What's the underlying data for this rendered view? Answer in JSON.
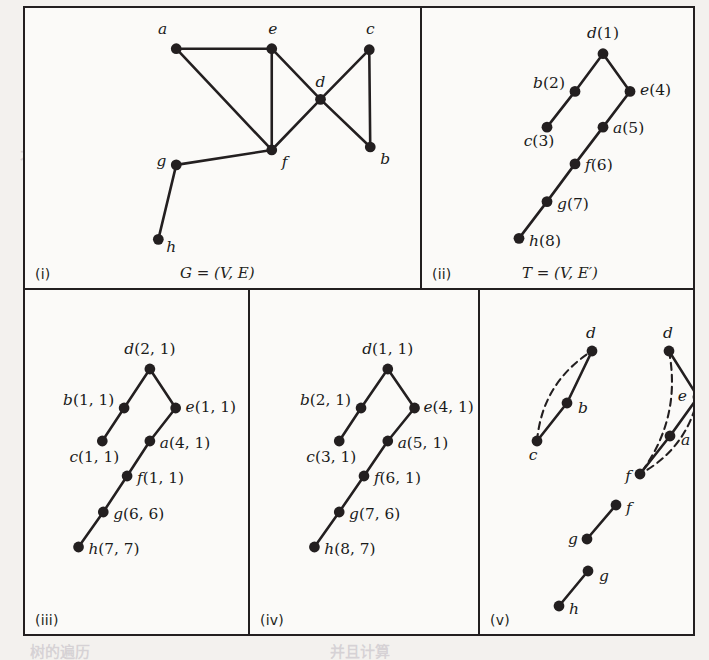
{
  "figure": {
    "title_absent": true,
    "background_color": "#f3f1ee",
    "paper_color": "#fbfaf8",
    "ink_color": "#231f20"
  },
  "panels": [
    {
      "id": "i",
      "tag": "(i)",
      "caption": "G = (V, E)",
      "kind": "graph",
      "nodes": [
        {
          "id": "a",
          "label": "a",
          "x": 152,
          "y": 41,
          "lx": 143,
          "ly": 26,
          "anchor": "end"
        },
        {
          "id": "e",
          "label": "e",
          "x": 248,
          "y": 41,
          "lx": 249,
          "ly": 26,
          "anchor": "middle"
        },
        {
          "id": "c",
          "label": "c",
          "x": 346,
          "y": 42,
          "lx": 347,
          "ly": 26,
          "anchor": "middle"
        },
        {
          "id": "d",
          "label": "d",
          "x": 297,
          "y": 92,
          "lx": 297,
          "ly": 80,
          "anchor": "middle"
        },
        {
          "id": "b",
          "label": "b",
          "x": 347,
          "y": 140,
          "lx": 357,
          "ly": 157,
          "anchor": "start"
        },
        {
          "id": "f",
          "label": "f",
          "x": 248,
          "y": 143,
          "lx": 258,
          "ly": 160,
          "anchor": "start"
        },
        {
          "id": "g",
          "label": "g",
          "x": 152,
          "y": 158,
          "lx": 142,
          "ly": 159,
          "anchor": "end"
        },
        {
          "id": "h",
          "label": "h",
          "x": 134,
          "y": 233,
          "lx": 142,
          "ly": 246,
          "anchor": "start"
        }
      ],
      "edges": [
        [
          "a",
          "e"
        ],
        [
          "a",
          "f"
        ],
        [
          "e",
          "f"
        ],
        [
          "e",
          "d"
        ],
        [
          "d",
          "c"
        ],
        [
          "d",
          "b"
        ],
        [
          "d",
          "f"
        ],
        [
          "c",
          "b"
        ],
        [
          "f",
          "g"
        ],
        [
          "g",
          "h"
        ]
      ]
    },
    {
      "id": "ii",
      "tag": "(ii)",
      "caption": "T = (V, E′)",
      "kind": "tree",
      "nodes": [
        {
          "id": "d",
          "label": "d(1)",
          "x": 578,
          "y": 46,
          "lx": 578,
          "ly": 30,
          "anchor": "middle"
        },
        {
          "id": "b",
          "label": "b(2)",
          "x": 550,
          "y": 84,
          "lx": 540,
          "ly": 81,
          "anchor": "end"
        },
        {
          "id": "e",
          "label": "e(4)",
          "x": 605,
          "y": 84,
          "lx": 615,
          "ly": 88,
          "anchor": "start"
        },
        {
          "id": "c",
          "label": "c(3)",
          "x": 522,
          "y": 120,
          "lx": 514,
          "ly": 139,
          "anchor": "middle"
        },
        {
          "id": "a",
          "label": "a(5)",
          "x": 578,
          "y": 120,
          "lx": 588,
          "ly": 126,
          "anchor": "start"
        },
        {
          "id": "f",
          "label": "f(6)",
          "x": 550,
          "y": 157,
          "lx": 560,
          "ly": 163,
          "anchor": "start"
        },
        {
          "id": "g",
          "label": "g(7)",
          "x": 522,
          "y": 195,
          "lx": 532,
          "ly": 202,
          "anchor": "start"
        },
        {
          "id": "h",
          "label": "h(8)",
          "x": 494,
          "y": 232,
          "lx": 504,
          "ly": 240,
          "anchor": "start"
        }
      ],
      "edges": [
        [
          "d",
          "b"
        ],
        [
          "b",
          "c"
        ],
        [
          "d",
          "e"
        ],
        [
          "e",
          "a"
        ],
        [
          "a",
          "f"
        ],
        [
          "f",
          "g"
        ],
        [
          "g",
          "h"
        ]
      ]
    },
    {
      "id": "iii",
      "tag": "(iii)",
      "caption": "",
      "kind": "tree",
      "nodes": [
        {
          "id": "d",
          "label": "d(2, 1)",
          "x": 126,
          "y": 361,
          "lx": 126,
          "ly": 346,
          "anchor": "middle"
        },
        {
          "id": "b",
          "label": "b(1, 1)",
          "x": 100,
          "y": 400,
          "lx": 90,
          "ly": 397,
          "anchor": "end"
        },
        {
          "id": "e",
          "label": "e(1, 1)",
          "x": 152,
          "y": 400,
          "lx": 162,
          "ly": 404,
          "anchor": "start"
        },
        {
          "id": "c",
          "label": "c(1, 1)",
          "x": 78,
          "y": 433,
          "lx": 70,
          "ly": 454,
          "anchor": "middle"
        },
        {
          "id": "a",
          "label": "a(4, 1)",
          "x": 126,
          "y": 433,
          "lx": 136,
          "ly": 440,
          "anchor": "start"
        },
        {
          "id": "f",
          "label": "f(1, 1)",
          "x": 103,
          "y": 468,
          "lx": 113,
          "ly": 475,
          "anchor": "start"
        },
        {
          "id": "g",
          "label": "g(6, 6)",
          "x": 79,
          "y": 504,
          "lx": 89,
          "ly": 511,
          "anchor": "start"
        },
        {
          "id": "h",
          "label": "h(7, 7)",
          "x": 54,
          "y": 539,
          "lx": 64,
          "ly": 546,
          "anchor": "start"
        }
      ],
      "edges": [
        [
          "d",
          "b"
        ],
        [
          "b",
          "c"
        ],
        [
          "d",
          "e"
        ],
        [
          "e",
          "a"
        ],
        [
          "a",
          "f"
        ],
        [
          "f",
          "g"
        ],
        [
          "g",
          "h"
        ]
      ]
    },
    {
      "id": "iv",
      "tag": "(iv)",
      "caption": "",
      "kind": "tree",
      "nodes": [
        {
          "id": "d",
          "label": "d(1, 1)",
          "x": 364,
          "y": 361,
          "lx": 364,
          "ly": 346,
          "anchor": "middle"
        },
        {
          "id": "b",
          "label": "b(2, 1)",
          "x": 337,
          "y": 400,
          "lx": 327,
          "ly": 397,
          "anchor": "end"
        },
        {
          "id": "e",
          "label": "e(4, 1)",
          "x": 391,
          "y": 400,
          "lx": 400,
          "ly": 404,
          "anchor": "start"
        },
        {
          "id": "c",
          "label": "c(3, 1)",
          "x": 315,
          "y": 433,
          "lx": 307,
          "ly": 454,
          "anchor": "middle"
        },
        {
          "id": "a",
          "label": "a(5, 1)",
          "x": 364,
          "y": 433,
          "lx": 374,
          "ly": 440,
          "anchor": "start"
        },
        {
          "id": "f",
          "label": "f(6, 1)",
          "x": 340,
          "y": 468,
          "lx": 350,
          "ly": 475,
          "anchor": "start"
        },
        {
          "id": "g",
          "label": "g(7, 6)",
          "x": 315,
          "y": 504,
          "lx": 325,
          "ly": 511,
          "anchor": "start"
        },
        {
          "id": "h",
          "label": "h(8, 7)",
          "x": 290,
          "y": 539,
          "lx": 300,
          "ly": 546,
          "anchor": "start"
        }
      ],
      "edges": [
        [
          "d",
          "b"
        ],
        [
          "b",
          "c"
        ],
        [
          "d",
          "e"
        ],
        [
          "e",
          "a"
        ],
        [
          "a",
          "f"
        ],
        [
          "f",
          "g"
        ],
        [
          "g",
          "h"
        ]
      ]
    },
    {
      "id": "v",
      "tag": "(v)",
      "caption": "",
      "kind": "components",
      "nodes": [
        {
          "id": "d1",
          "label": "d",
          "x": 567,
          "y": 343,
          "lx": 566,
          "ly": 330,
          "anchor": "middle"
        },
        {
          "id": "b1",
          "label": "b",
          "x": 542,
          "y": 395,
          "lx": 553,
          "ly": 405,
          "anchor": "start"
        },
        {
          "id": "c1",
          "label": "c",
          "x": 512,
          "y": 433,
          "lx": 508,
          "ly": 452,
          "anchor": "middle"
        },
        {
          "id": "d2",
          "label": "d",
          "x": 644,
          "y": 343,
          "lx": 643,
          "ly": 330,
          "anchor": "middle"
        },
        {
          "id": "e2",
          "label": "e",
          "x": 673,
          "y": 389,
          "lx": 662,
          "ly": 393,
          "anchor": "end"
        },
        {
          "id": "a2",
          "label": "a",
          "x": 645,
          "y": 428,
          "lx": 656,
          "ly": 437,
          "anchor": "start"
        },
        {
          "id": "f2",
          "label": "f",
          "x": 615,
          "y": 466,
          "lx": 606,
          "ly": 473,
          "anchor": "end"
        },
        {
          "id": "f3",
          "label": "f",
          "x": 591,
          "y": 497,
          "lx": 601,
          "ly": 505,
          "anchor": "start"
        },
        {
          "id": "g3",
          "label": "g",
          "x": 562,
          "y": 531,
          "lx": 553,
          "ly": 536,
          "anchor": "end"
        },
        {
          "id": "g4",
          "label": "g",
          "x": 563,
          "y": 563,
          "lx": 574,
          "ly": 573,
          "anchor": "start"
        },
        {
          "id": "h4",
          "label": "h",
          "x": 534,
          "y": 598,
          "lx": 544,
          "ly": 606,
          "anchor": "start"
        }
      ],
      "edges": [
        [
          "d1",
          "b1"
        ],
        [
          "b1",
          "c1"
        ],
        [
          "d2",
          "e2"
        ],
        [
          "e2",
          "a2"
        ],
        [
          "a2",
          "f2"
        ],
        [
          "f3",
          "g3"
        ],
        [
          "g4",
          "h4"
        ]
      ],
      "dashed_arcs": [
        {
          "from": "c1",
          "to": "d1",
          "bulge": -26
        },
        {
          "from": "d2",
          "to": "f2",
          "bulge": -28
        },
        {
          "from": "e2",
          "to": "f2",
          "bulge": -22
        }
      ]
    }
  ],
  "ghost_text": [
    {
      "text": "式。同样，在图中",
      "x": 55,
      "y": 16,
      "size": 15
    },
    {
      "text": "一个顶点的所有",
      "x": 430,
      "y": 14,
      "size": 15
    },
    {
      "text": "的边集合",
      "x": 30,
      "y": 58,
      "size": 15
    },
    {
      "text": "所示的连通图",
      "x": 440,
      "y": 50,
      "size": 15
    },
    {
      "text": "T 是一棵生成",
      "x": 560,
      "y": 50,
      "size": 15
    },
    {
      "text": "对应的树构",
      "x": 430,
      "y": 100,
      "size": 15
    },
    {
      "text": "单调性的序",
      "x": 560,
      "y": 100,
      "size": 15
    },
    {
      "text": "不是唯一的",
      "x": 20,
      "y": 146,
      "size": 15
    },
    {
      "text": "结果。",
      "x": 430,
      "y": 146,
      "size": 15
    },
    {
      "text": "连通分量",
      "x": 470,
      "y": 178,
      "size": 15
    },
    {
      "text": "序列结构",
      "x": 430,
      "y": 330,
      "size": 15
    },
    {
      "text": "树的遍历",
      "x": 30,
      "y": 640,
      "size": 15
    },
    {
      "text": "并且计算",
      "x": 330,
      "y": 640,
      "size": 15
    }
  ]
}
